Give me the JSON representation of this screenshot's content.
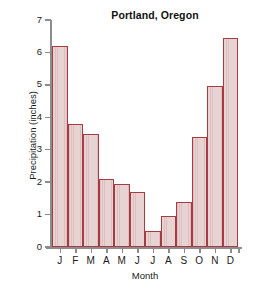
{
  "chart_data": {
    "type": "bar",
    "title": "Portland, Oregon",
    "xlabel": "Month",
    "ylabel": "Precipitation (inches)",
    "categories": [
      "J",
      "F",
      "M",
      "A",
      "M",
      "J",
      "J",
      "A",
      "S",
      "O",
      "N",
      "D"
    ],
    "values": [
      6.2,
      3.8,
      3.5,
      2.1,
      1.95,
      1.7,
      0.5,
      0.95,
      1.4,
      3.4,
      4.95,
      6.45
    ],
    "ylim": [
      0,
      7
    ],
    "yticks": [
      0,
      1,
      2,
      3,
      4,
      5,
      6,
      7
    ],
    "ytick_labels": [
      "0",
      "1",
      "2",
      "3",
      "4",
      "5",
      "6",
      "7"
    ],
    "grid": false,
    "legend": null,
    "bar_fill_color": "#e8d3d3",
    "bar_edge_color": "#a63b43",
    "axis_color": "#8c8c8c",
    "background_color": "#ffffff"
  }
}
